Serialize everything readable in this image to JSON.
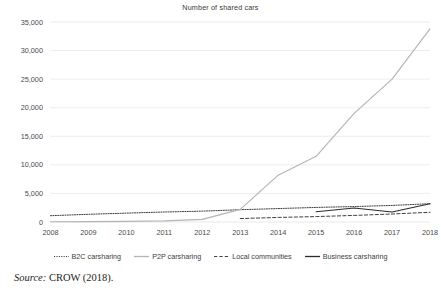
{
  "chart_data": {
    "type": "line",
    "title": "Number of shared cars",
    "xlabel": "",
    "ylabel": "",
    "x": [
      2008,
      2009,
      2010,
      2011,
      2012,
      2013,
      2014,
      2015,
      2016,
      2017,
      2018
    ],
    "categories": [
      "2008",
      "2009",
      "2010",
      "2011",
      "2012",
      "2013",
      "2014",
      "2015",
      "2016",
      "2017",
      "2018"
    ],
    "xlim": [
      2008,
      2018
    ],
    "ylim": [
      0,
      35000
    ],
    "yticks": [
      0,
      5000,
      10000,
      15000,
      20000,
      25000,
      30000,
      35000
    ],
    "ytick_labels": [
      "0",
      "5,000",
      "10,000",
      "15,000",
      "20,000",
      "25,000",
      "30,000",
      "35,000"
    ],
    "grid": true,
    "grid_axis": "y",
    "legend_position": "bottom",
    "series": [
      {
        "name": "B2C carsharing",
        "style": "dotted",
        "color": "#3f3f3f",
        "x": [
          2008,
          2009,
          2010,
          2011,
          2012,
          2013,
          2014,
          2015,
          2016,
          2017,
          2018
        ],
        "values": [
          1100,
          1350,
          1550,
          1750,
          1900,
          2150,
          2350,
          2550,
          2700,
          2900,
          3200
        ]
      },
      {
        "name": "P2P carsharing",
        "style": "solid",
        "color": "#b4b4b4",
        "x": [
          2008,
          2009,
          2010,
          2011,
          2012,
          2013,
          2014,
          2015,
          2016,
          2017,
          2018
        ],
        "values": [
          50,
          70,
          100,
          200,
          450,
          2200,
          8200,
          11500,
          19000,
          25000,
          33800
        ]
      },
      {
        "name": "Local communities",
        "style": "dashed",
        "color": "#3f3f3f",
        "x": [
          2013,
          2014,
          2015,
          2016,
          2017,
          2018
        ],
        "values": [
          600,
          800,
          950,
          1150,
          1400,
          1700
        ]
      },
      {
        "name": "Business carsharing",
        "style": "solid",
        "color": "#2b2b2b",
        "x": [
          2015,
          2016,
          2017,
          2018
        ],
        "values": [
          1800,
          2450,
          1750,
          3200
        ]
      }
    ]
  },
  "caption": {
    "source_word": "Source:",
    "source_text": "CROW (2018)."
  },
  "colors": {
    "grid": "#e8e8e8",
    "axis_text": "#4a4a4a",
    "title_text": "#3a3a3a"
  }
}
